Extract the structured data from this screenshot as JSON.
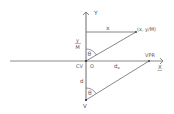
{
  "diagram": {
    "type": "geometric-projection",
    "colors": {
      "line": "#6a6a6a",
      "text": "#555555",
      "background": "#ffffff"
    },
    "axes": {
      "y_label": "Y",
      "x_label": "X"
    },
    "labels": {
      "x_segment": "x",
      "point": "(x, y/M)",
      "y_over_m_num": "y",
      "y_over_m_den": "M",
      "theta_upper": "θ",
      "theta_lower": "θ",
      "cv": "CV",
      "origin": "O",
      "d_e_main": "d",
      "d_e_sub": "e",
      "vpr": "VPR",
      "d": "d",
      "v": "V"
    }
  }
}
